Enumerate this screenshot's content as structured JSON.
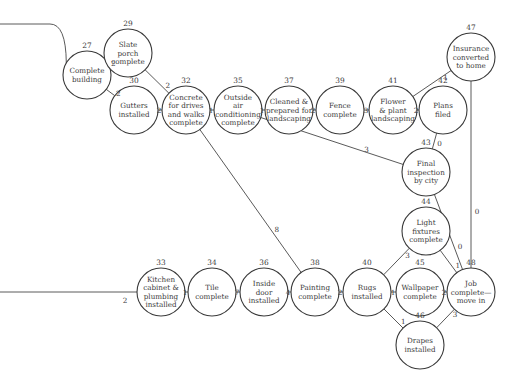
{
  "diagram": {
    "type": "project-network (activity-on-node)",
    "nodes": [
      {
        "id": "27",
        "label": [
          "Complete",
          "building"
        ],
        "x": 87,
        "y": 75
      },
      {
        "id": "29",
        "label": [
          "Slate",
          "porch",
          "complete"
        ],
        "x": 128,
        "y": 53
      },
      {
        "id": "30",
        "label": [
          "Gutters",
          "installed"
        ],
        "x": 134,
        "y": 110
      },
      {
        "id": "32",
        "label": [
          "Concrete",
          "for drives",
          "and walks",
          "complete"
        ],
        "x": 186,
        "y": 110
      },
      {
        "id": "35",
        "label": [
          "Outside",
          "air",
          "conditioning",
          "complete"
        ],
        "x": 238,
        "y": 110
      },
      {
        "id": "37",
        "label": [
          "Cleaned &",
          "prepared for",
          "landscaping"
        ],
        "x": 289,
        "y": 110
      },
      {
        "id": "39",
        "label": [
          "Fence",
          "complete"
        ],
        "x": 340,
        "y": 110
      },
      {
        "id": "41",
        "label": [
          "Flower",
          "& plant",
          "landscaping"
        ],
        "x": 393,
        "y": 110
      },
      {
        "id": "42",
        "label": [
          "Plans",
          "filed"
        ],
        "x": 443,
        "y": 110
      },
      {
        "id": "47",
        "label": [
          "Insurance",
          "converted",
          "to home"
        ],
        "x": 471,
        "y": 57
      },
      {
        "id": "43",
        "label": [
          "Final",
          "inspection",
          "by city"
        ],
        "x": 426,
        "y": 172
      },
      {
        "id": "44",
        "label": [
          "Light",
          "fixtures",
          "complete"
        ],
        "x": 426,
        "y": 231
      },
      {
        "id": "33",
        "label": [
          "Kitchen",
          "cabinet &",
          "plumbing",
          "installed"
        ],
        "x": 161,
        "y": 292
      },
      {
        "id": "34",
        "label": [
          "Tile",
          "complete"
        ],
        "x": 212,
        "y": 292
      },
      {
        "id": "36",
        "label": [
          "Inside",
          "door",
          "installed"
        ],
        "x": 264,
        "y": 292
      },
      {
        "id": "38",
        "label": [
          "Painting",
          "complete"
        ],
        "x": 315,
        "y": 292
      },
      {
        "id": "40",
        "label": [
          "Rugs",
          "installed"
        ],
        "x": 367,
        "y": 292
      },
      {
        "id": "45",
        "label": [
          "Wallpaper",
          "complete"
        ],
        "x": 420,
        "y": 292
      },
      {
        "id": "48",
        "label": [
          "Job",
          "complete—",
          "move in"
        ],
        "x": 471,
        "y": 292
      },
      {
        "id": "46",
        "label": [
          "Drapes",
          "installed"
        ],
        "x": 420,
        "y": 345
      }
    ],
    "edges": [
      {
        "from": "start-top",
        "to": "27",
        "weight": ""
      },
      {
        "from": "27",
        "to": "29",
        "weight": "2"
      },
      {
        "from": "27",
        "to": "30",
        "weight": "2"
      },
      {
        "from": "29",
        "to": "32",
        "weight": "2"
      },
      {
        "from": "30",
        "to": "32",
        "weight": "2"
      },
      {
        "from": "32",
        "to": "35",
        "weight": "1"
      },
      {
        "from": "35",
        "to": "37",
        "weight": "1"
      },
      {
        "from": "37",
        "to": "39",
        "weight": "2"
      },
      {
        "from": "39",
        "to": "41",
        "weight": "3"
      },
      {
        "from": "41",
        "to": "42",
        "weight": "2"
      },
      {
        "from": "41",
        "to": "47",
        "weight": "1"
      },
      {
        "from": "42",
        "to": "43",
        "weight": "0"
      },
      {
        "from": "35",
        "to": "43",
        "weight": "3"
      },
      {
        "from": "47",
        "to": "48",
        "weight": "0"
      },
      {
        "from": "43",
        "to": "48",
        "weight": "0"
      },
      {
        "from": "32",
        "to": "38",
        "weight": "8"
      },
      {
        "from": "start-bottom",
        "to": "33",
        "weight": "2"
      },
      {
        "from": "33",
        "to": "34",
        "weight": "1"
      },
      {
        "from": "34",
        "to": "36",
        "weight": "7"
      },
      {
        "from": "36",
        "to": "38",
        "weight": "4"
      },
      {
        "from": "38",
        "to": "40",
        "weight": "2"
      },
      {
        "from": "40",
        "to": "44",
        "weight": "3"
      },
      {
        "from": "40",
        "to": "45",
        "weight": "1"
      },
      {
        "from": "40",
        "to": "46",
        "weight": "1"
      },
      {
        "from": "44",
        "to": "48",
        "weight": "1"
      },
      {
        "from": "45",
        "to": "48",
        "weight": "2"
      },
      {
        "from": "46",
        "to": "48",
        "weight": "3"
      }
    ]
  }
}
